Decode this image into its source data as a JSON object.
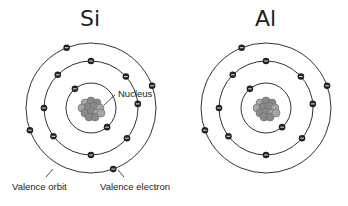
{
  "diagram": {
    "atoms": [
      {
        "symbol": "Si",
        "center": [
          91,
          108
        ],
        "shells": [
          {
            "radius": 25,
            "electrons": 2,
            "angles": [
              -130,
              50
            ]
          },
          {
            "radius": 47,
            "electrons": 8,
            "angles": [
              -90,
              -42,
              -5,
              40,
              90,
              143,
              180,
              225
            ]
          },
          {
            "radius": 65,
            "electrons": 4,
            "angles": [
              -112,
              -20,
              70,
              160
            ]
          }
        ]
      },
      {
        "symbol": "Al",
        "center": [
          266,
          108
        ],
        "shells": [
          {
            "radius": 25,
            "electrons": 2,
            "angles": [
              -130,
              50
            ]
          },
          {
            "radius": 47,
            "electrons": 8,
            "angles": [
              -90,
              -42,
              -5,
              40,
              90,
              143,
              180,
              225
            ]
          },
          {
            "radius": 65,
            "electrons": 3,
            "angles": [
              -112,
              -20,
              160
            ]
          }
        ]
      }
    ],
    "labels": {
      "nucleus": "Nucleus",
      "valence_orbit": "Valence orbit",
      "valence_electron": "Valence electron"
    },
    "colors": {
      "orbit": "#333333",
      "electron": "#222222",
      "nucleus_particle": "#8a8a8a",
      "text": "#222222"
    }
  }
}
